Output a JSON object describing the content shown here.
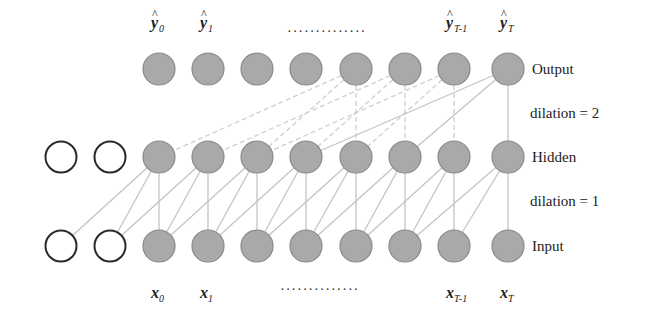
{
  "diagram": {
    "layers": [
      {
        "id": "output",
        "label": "Output",
        "y": 69
      },
      {
        "id": "hidden",
        "label": "Hidden",
        "y": 157
      },
      {
        "id": "input",
        "label": "Input",
        "y": 246
      }
    ],
    "dilation_labels": [
      {
        "text": "dilation = 2",
        "x": 530,
        "y": 118
      },
      {
        "text": "dilation = 1",
        "x": 530,
        "y": 206
      }
    ],
    "columns_x": [
      159,
      208,
      257,
      306,
      356,
      405,
      454,
      508
    ],
    "padding_columns_x": [
      61,
      110
    ],
    "node_radius": 16,
    "colors": {
      "node_fill": "#a9a9a9",
      "node_stroke": "#8a8a8a",
      "padding_stroke": "#2a2a2a",
      "edge_solid": "#c4c4c4",
      "edge_dashed": "#cfcfcf",
      "text": "#222222"
    },
    "output_labels": [
      {
        "base": "y",
        "hat": true,
        "sub": "0",
        "col": 0
      },
      {
        "base": "y",
        "hat": true,
        "sub": "1",
        "col": 1
      },
      {
        "base": "y",
        "hat": true,
        "sub": "T-1",
        "col": 6
      },
      {
        "base": "y",
        "hat": true,
        "sub": "T",
        "col": 7
      }
    ],
    "output_ellipsis": {
      "text": "··············",
      "x": 287,
      "y": 36
    },
    "input_labels": [
      {
        "base": "x",
        "sub": "0",
        "col": 0
      },
      {
        "base": "x",
        "sub": "1",
        "col": 1
      },
      {
        "base": "x",
        "sub": "T-1",
        "col": 6
      },
      {
        "base": "x",
        "sub": "T",
        "col": 7
      }
    ],
    "input_ellipsis": {
      "text": "··············",
      "x": 280,
      "y": 294
    },
    "hidden_to_input_edges": {
      "kernel_offsets": [
        0,
        1,
        2
      ],
      "dilation": 1,
      "style": "solid"
    },
    "output_to_hidden_edges": {
      "solid_from": [
        7
      ],
      "dashed_from": [
        4,
        5,
        6
      ],
      "kernel_offsets": [
        0,
        2,
        4
      ],
      "dilation": 2
    }
  }
}
